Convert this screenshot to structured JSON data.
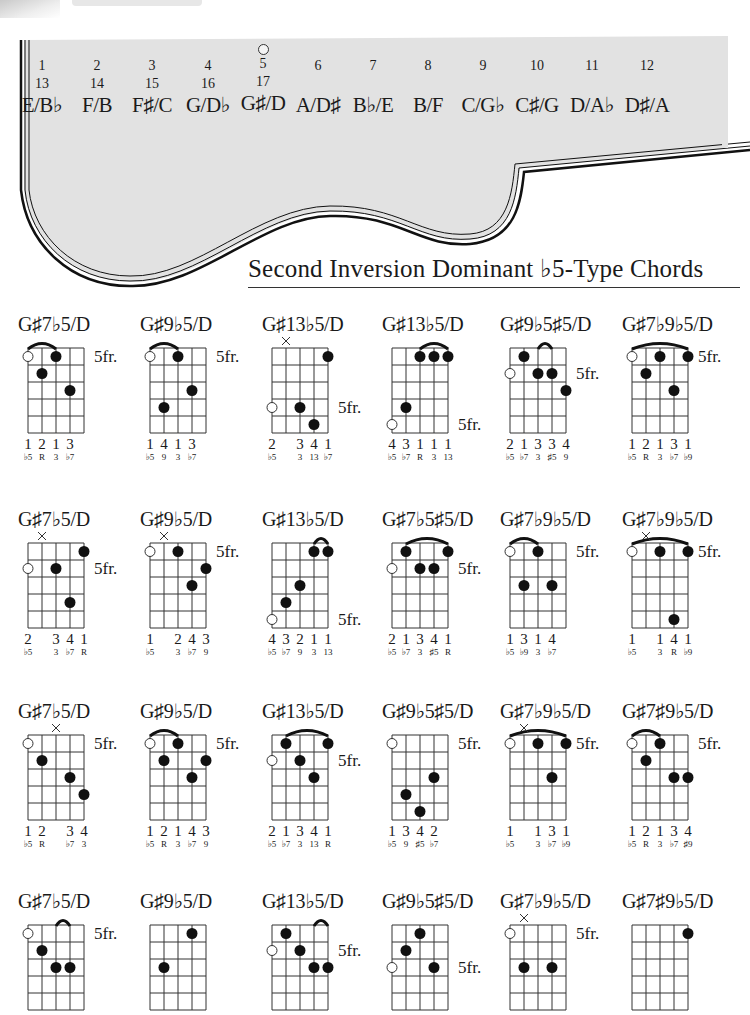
{
  "fretboard": {
    "frets": [
      {
        "num": "1",
        "num2": "13",
        "note": "E/B♭"
      },
      {
        "num": "2",
        "num2": "14",
        "note": "F/B"
      },
      {
        "num": "3",
        "num2": "15",
        "note": "F♯/C"
      },
      {
        "num": "4",
        "num2": "16",
        "note": "G/D♭"
      },
      {
        "num": "5",
        "num2": "17",
        "note": "G♯/D",
        "marker": true
      },
      {
        "num": "6",
        "num2": "",
        "note": "A/D♯"
      },
      {
        "num": "7",
        "num2": "",
        "note": "B♭/E"
      },
      {
        "num": "8",
        "num2": "",
        "note": "B/F"
      },
      {
        "num": "9",
        "num2": "",
        "note": "C/G♭"
      },
      {
        "num": "10",
        "num2": "",
        "note": "C♯/G"
      },
      {
        "num": "11",
        "num2": "",
        "note": "D/A♭"
      },
      {
        "num": "12",
        "num2": "",
        "note": "D♯/A"
      }
    ],
    "fill_color": "#e2e2e2",
    "outline_color": "#111111"
  },
  "section": {
    "title": "Second Inversion Dominant ♭5-Type Chords"
  },
  "fret_label": "5fr.",
  "chords": [
    {
      "name": "G♯7♭5/D",
      "fr_row": 0,
      "barres": [
        [
          0,
          2
        ]
      ],
      "mutes": [],
      "dots": [
        [
          0,
          0,
          "o"
        ],
        [
          2,
          0,
          "f"
        ],
        [
          1,
          1,
          "f"
        ],
        [
          3,
          2,
          "f"
        ]
      ],
      "fingers": [
        "1",
        "2",
        "1",
        "3",
        ""
      ],
      "intervals": [
        "♭5",
        "R",
        "3",
        "♭7",
        ""
      ]
    },
    {
      "name": "G♯9♭5/D",
      "fr_row": 0,
      "barres": [
        [
          0,
          2
        ]
      ],
      "mutes": [],
      "dots": [
        [
          0,
          0,
          "o"
        ],
        [
          2,
          0,
          "f"
        ],
        [
          3,
          2,
          "f"
        ],
        [
          1,
          3,
          "f"
        ]
      ],
      "fingers": [
        "1",
        "4",
        "1",
        "3",
        ""
      ],
      "intervals": [
        "♭5",
        "9",
        "3",
        "♭7",
        ""
      ]
    },
    {
      "name": "G♯13♭5/D",
      "fr_row": 3,
      "barres": [],
      "mutes": [
        1
      ],
      "dots": [
        [
          4,
          0,
          "f"
        ],
        [
          0,
          3,
          "o"
        ],
        [
          2,
          3,
          "f"
        ],
        [
          3,
          4,
          "f"
        ]
      ],
      "fingers": [
        "2",
        "",
        "3",
        "4",
        "1"
      ],
      "intervals": [
        "♭5",
        "",
        "3",
        "13",
        "♭7"
      ]
    },
    {
      "name": "G♯13♭5/D",
      "fr_row": 4,
      "barres": [
        [
          2,
          4
        ]
      ],
      "mutes": [],
      "dots": [
        [
          2,
          0,
          "f"
        ],
        [
          3,
          0,
          "f"
        ],
        [
          4,
          0,
          "f"
        ],
        [
          1,
          3,
          "f"
        ],
        [
          0,
          4,
          "o"
        ]
      ],
      "fingers": [
        "4",
        "3",
        "1",
        "1",
        "1"
      ],
      "intervals": [
        "♭5",
        "♭7",
        "R",
        "3",
        "13"
      ]
    },
    {
      "name": "G♯9♭5♯5/D",
      "fr_row": 1,
      "barres": [
        [
          2,
          3
        ]
      ],
      "mutes": [],
      "dots": [
        [
          1,
          0,
          "f"
        ],
        [
          0,
          1,
          "o"
        ],
        [
          2,
          1,
          "f"
        ],
        [
          3,
          1,
          "f"
        ],
        [
          4,
          2,
          "f"
        ]
      ],
      "fingers": [
        "2",
        "1",
        "3",
        "3",
        "4"
      ],
      "intervals": [
        "♭5",
        "♭7",
        "3",
        "♯5",
        "9"
      ]
    },
    {
      "name": "G♯7♭9♭5/D",
      "fr_row": 0,
      "barres": [
        [
          0,
          4
        ]
      ],
      "mutes": [],
      "dots": [
        [
          0,
          0,
          "o"
        ],
        [
          2,
          0,
          "f"
        ],
        [
          4,
          0,
          "f"
        ],
        [
          1,
          1,
          "f"
        ],
        [
          3,
          2,
          "f"
        ]
      ],
      "fingers": [
        "1",
        "2",
        "1",
        "3",
        "1"
      ],
      "intervals": [
        "♭5",
        "R",
        "3",
        "♭7",
        "♭9"
      ]
    },
    {
      "name": "G♯7♭5/D",
      "fr_row": 1,
      "barres": [],
      "mutes": [
        1
      ],
      "dots": [
        [
          4,
          0,
          "f"
        ],
        [
          0,
          1,
          "o"
        ],
        [
          2,
          1,
          "f"
        ],
        [
          3,
          3,
          "f"
        ]
      ],
      "fingers": [
        "2",
        "",
        "3",
        "4",
        "1"
      ],
      "intervals": [
        "♭5",
        "",
        "3",
        "♭7",
        "R"
      ]
    },
    {
      "name": "G♯9♭5/D",
      "fr_row": 0,
      "barres": [],
      "mutes": [
        1
      ],
      "dots": [
        [
          0,
          0,
          "o"
        ],
        [
          2,
          0,
          "f"
        ],
        [
          4,
          1,
          "f"
        ],
        [
          3,
          2,
          "f"
        ]
      ],
      "fingers": [
        "1",
        "",
        "2",
        "4",
        "3"
      ],
      "intervals": [
        "♭5",
        "",
        "3",
        "♭7",
        "9"
      ]
    },
    {
      "name": "G♯13♭5/D",
      "fr_row": 4,
      "barres": [
        [
          3,
          4
        ]
      ],
      "mutes": [],
      "dots": [
        [
          3,
          0,
          "f"
        ],
        [
          4,
          0,
          "f"
        ],
        [
          2,
          2,
          "f"
        ],
        [
          1,
          3,
          "f"
        ],
        [
          0,
          4,
          "o"
        ]
      ],
      "fingers": [
        "4",
        "3",
        "2",
        "1",
        "1"
      ],
      "intervals": [
        "♭5",
        "♭7",
        "9",
        "3",
        "13"
      ]
    },
    {
      "name": "G♯7♭5♯5/D",
      "fr_row": 1,
      "barres": [
        [
          1,
          4
        ]
      ],
      "mutes": [],
      "dots": [
        [
          1,
          0,
          "f"
        ],
        [
          4,
          0,
          "f"
        ],
        [
          0,
          1,
          "o"
        ],
        [
          2,
          1,
          "f"
        ],
        [
          3,
          1,
          "f"
        ]
      ],
      "fingers": [
        "2",
        "1",
        "3",
        "4",
        "1"
      ],
      "intervals": [
        "♭5",
        "♭7",
        "3",
        "♯5",
        "R"
      ]
    },
    {
      "name": "G♯7♭9♭5/D",
      "fr_row": 0,
      "barres": [
        [
          0,
          2
        ]
      ],
      "mutes": [],
      "dots": [
        [
          0,
          0,
          "o"
        ],
        [
          2,
          0,
          "f"
        ],
        [
          1,
          2,
          "f"
        ],
        [
          3,
          2,
          "f"
        ]
      ],
      "fingers": [
        "1",
        "3",
        "1",
        "4",
        ""
      ],
      "intervals": [
        "♭5",
        "♭9",
        "3",
        "♭7",
        ""
      ]
    },
    {
      "name": "G♯7♭9♭5/D",
      "fr_row": 0,
      "barres": [
        [
          0,
          4
        ]
      ],
      "mutes": [
        1
      ],
      "dots": [
        [
          0,
          0,
          "o"
        ],
        [
          2,
          0,
          "f"
        ],
        [
          4,
          0,
          "f"
        ],
        [
          3,
          4,
          "f"
        ]
      ],
      "fingers": [
        "1",
        "",
        "1",
        "4",
        "1"
      ],
      "intervals": [
        "♭5",
        "",
        "3",
        "R",
        "♭9"
      ]
    },
    {
      "name": "G♯7♭5/D",
      "fr_row": 0,
      "barres": [],
      "mutes": [
        2
      ],
      "dots": [
        [
          0,
          0,
          "o"
        ],
        [
          1,
          1,
          "f"
        ],
        [
          3,
          2,
          "f"
        ],
        [
          4,
          3,
          "f"
        ]
      ],
      "fingers": [
        "1",
        "2",
        "",
        "3",
        "4"
      ],
      "intervals": [
        "♭5",
        "R",
        "",
        "♭7",
        "3"
      ]
    },
    {
      "name": "G♯9♭5/D",
      "fr_row": 0,
      "barres": [
        [
          0,
          2
        ]
      ],
      "mutes": [],
      "dots": [
        [
          0,
          0,
          "o"
        ],
        [
          2,
          0,
          "f"
        ],
        [
          1,
          1,
          "f"
        ],
        [
          4,
          1,
          "f"
        ],
        [
          3,
          2,
          "f"
        ]
      ],
      "fingers": [
        "1",
        "2",
        "1",
        "4",
        "3"
      ],
      "intervals": [
        "♭5",
        "R",
        "3",
        "♭7",
        "9"
      ]
    },
    {
      "name": "G♯13♭5/D",
      "fr_row": 1,
      "barres": [
        [
          1,
          4
        ]
      ],
      "mutes": [],
      "dots": [
        [
          1,
          0,
          "f"
        ],
        [
          4,
          0,
          "f"
        ],
        [
          0,
          1,
          "o"
        ],
        [
          2,
          1,
          "f"
        ],
        [
          3,
          2,
          "f"
        ]
      ],
      "fingers": [
        "2",
        "1",
        "3",
        "4",
        "1"
      ],
      "intervals": [
        "♭5",
        "♭7",
        "3",
        "13",
        "R"
      ]
    },
    {
      "name": "G♯9♭5♯5/D",
      "fr_row": 0,
      "barres": [],
      "mutes": [],
      "dots": [
        [
          0,
          0,
          "o"
        ],
        [
          3,
          2,
          "f"
        ],
        [
          1,
          3,
          "f"
        ],
        [
          2,
          4,
          "f"
        ]
      ],
      "fingers": [
        "1",
        "3",
        "4",
        "2",
        ""
      ],
      "intervals": [
        "♭5",
        "9",
        "♯5",
        "♭7",
        ""
      ]
    },
    {
      "name": "G♯7♭9♭5/D",
      "fr_row": 0,
      "barres": [
        [
          0,
          4
        ]
      ],
      "mutes": [
        1
      ],
      "dots": [
        [
          0,
          0,
          "o"
        ],
        [
          2,
          0,
          "f"
        ],
        [
          4,
          0,
          "f"
        ],
        [
          3,
          2,
          "f"
        ]
      ],
      "fingers": [
        "1",
        "",
        "1",
        "3",
        "1"
      ],
      "intervals": [
        "♭5",
        "",
        "3",
        "♭7",
        "♭9"
      ]
    },
    {
      "name": "G♯7♯9♭5/D",
      "fr_row": 0,
      "barres": [
        [
          0,
          2
        ]
      ],
      "mutes": [],
      "dots": [
        [
          0,
          0,
          "o"
        ],
        [
          2,
          0,
          "f"
        ],
        [
          1,
          1,
          "f"
        ],
        [
          3,
          2,
          "f"
        ],
        [
          4,
          2,
          "f"
        ]
      ],
      "fingers": [
        "1",
        "2",
        "1",
        "3",
        "4"
      ],
      "intervals": [
        "♭5",
        "R",
        "3",
        "♭7",
        "♯9"
      ]
    },
    {
      "name": "G♯7♭5/D",
      "fr_row": 0,
      "barres": [
        [
          2,
          3
        ]
      ],
      "mutes": [],
      "dots": [
        [
          0,
          0,
          "o"
        ],
        [
          1,
          1,
          "f"
        ],
        [
          2,
          2,
          "f"
        ],
        [
          3,
          2,
          "f"
        ]
      ],
      "fingers": [
        "",
        "",
        "",
        "",
        ""
      ],
      "intervals": [
        "",
        "",
        "",
        "",
        ""
      ]
    },
    {
      "name": "G♯9♭5/D",
      "fr_row": -1,
      "barres": [],
      "mutes": [],
      "dots": [
        [
          3,
          0,
          "f"
        ],
        [
          1,
          2,
          "f"
        ]
      ],
      "fingers": [
        "",
        "",
        "",
        "",
        ""
      ],
      "intervals": [
        "",
        "",
        "",
        "",
        ""
      ]
    },
    {
      "name": "G♯13♭5/D",
      "fr_row": 1,
      "barres": [
        [
          3,
          4
        ]
      ],
      "mutes": [],
      "dots": [
        [
          1,
          0,
          "f"
        ],
        [
          0,
          1,
          "o"
        ],
        [
          2,
          1,
          "f"
        ],
        [
          3,
          2,
          "f"
        ],
        [
          4,
          2,
          "f"
        ]
      ],
      "fingers": [
        "",
        "",
        "",
        "",
        ""
      ],
      "intervals": [
        "",
        "",
        "",
        "",
        ""
      ]
    },
    {
      "name": "G♯9♭5♯5/D",
      "fr_row": 2,
      "barres": [],
      "mutes": [],
      "dots": [
        [
          2,
          0,
          "f"
        ],
        [
          1,
          1,
          "f"
        ],
        [
          0,
          2,
          "o"
        ],
        [
          3,
          2,
          "f"
        ]
      ],
      "fingers": [
        "",
        "",
        "",
        "",
        ""
      ],
      "intervals": [
        "",
        "",
        "",
        "",
        ""
      ]
    },
    {
      "name": "G♯7♭9♭5/D",
      "fr_row": 0,
      "barres": [],
      "mutes": [
        1
      ],
      "dots": [
        [
          0,
          0,
          "o"
        ],
        [
          1,
          2,
          "f"
        ],
        [
          3,
          2,
          "f"
        ]
      ],
      "fingers": [
        "",
        "",
        "",
        "",
        ""
      ],
      "intervals": [
        "",
        "",
        "",
        "",
        ""
      ]
    },
    {
      "name": "G♯7♯9♭5/D",
      "fr_row": -1,
      "barres": [],
      "mutes": [],
      "dots": [
        [
          4,
          0,
          "f"
        ]
      ],
      "fingers": [
        "",
        "",
        "",
        "",
        ""
      ],
      "intervals": [
        "",
        "",
        "",
        "",
        ""
      ]
    }
  ]
}
